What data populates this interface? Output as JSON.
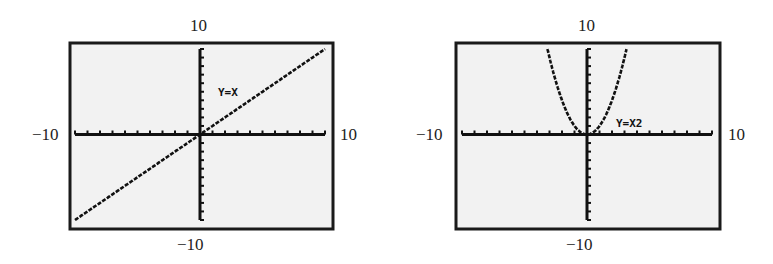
{
  "figures": [
    {
      "id": "linear",
      "equation_label": "Y=X",
      "window": {
        "xmin": "-10",
        "xmax": "10",
        "ymin": "-10",
        "ymax": "10"
      },
      "labels": {
        "top": "10",
        "bottom": "−10",
        "left": "−10",
        "right": "10"
      }
    },
    {
      "id": "quadratic",
      "equation_label": "Y=X2",
      "window": {
        "xmin": "-10",
        "xmax": "10",
        "ymin": "-10",
        "ymax": "10"
      },
      "labels": {
        "top": "10",
        "bottom": "−10",
        "left": "−10",
        "right": "10"
      }
    }
  ],
  "colors": {
    "screen_bg": "#f2f2f2",
    "frame": "#1a1a1a",
    "ink": "#111111"
  },
  "chart_data": [
    {
      "type": "line",
      "title": "Y=X",
      "xlabel": "",
      "ylabel": "",
      "xlim": [
        -10,
        10
      ],
      "ylim": [
        -10,
        10
      ],
      "x_ticks_scale": 1,
      "y_ticks_scale": 1,
      "grid": false,
      "series": [
        {
          "name": "Y=X",
          "x": [
            -10,
            -5,
            0,
            5,
            10
          ],
          "y": [
            -10,
            -5,
            0,
            5,
            10
          ]
        }
      ]
    },
    {
      "type": "line",
      "title": "Y=X2",
      "xlabel": "",
      "ylabel": "",
      "xlim": [
        -10,
        10
      ],
      "ylim": [
        -10,
        10
      ],
      "x_ticks_scale": 1,
      "y_ticks_scale": 1,
      "grid": false,
      "series": [
        {
          "name": "Y=X^2",
          "x": [
            -3.16,
            -3,
            -2,
            -1,
            0,
            1,
            2,
            3,
            3.16
          ],
          "y": [
            10,
            9,
            4,
            1,
            0,
            1,
            4,
            9,
            10
          ]
        }
      ]
    }
  ]
}
